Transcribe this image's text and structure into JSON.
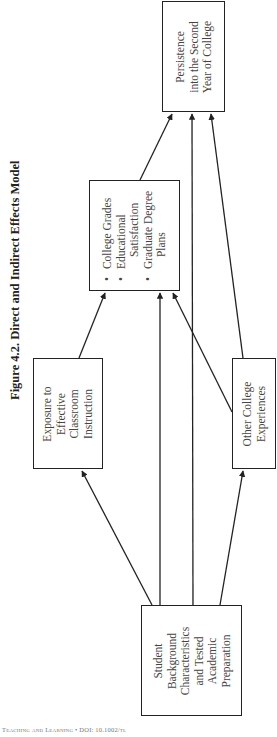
{
  "figure": {
    "title": "Figure 4.2.  Direct and Indirect Effects Model"
  },
  "nodes": {
    "background": {
      "label_lines": [
        "Student",
        "Background",
        "Characteristics",
        "and Tested",
        "Academic",
        "Preparation"
      ]
    },
    "exposure": {
      "label_lines": [
        "Exposure to",
        "Effective",
        "Classroom",
        "Instruction"
      ]
    },
    "other": {
      "label_lines": [
        "Other College",
        "Experiences"
      ]
    },
    "outcomes": {
      "items": [
        {
          "text": "College Grades",
          "bullet": true
        },
        {
          "text": "Educational",
          "bullet": true
        },
        {
          "text": "Satisfaction",
          "bullet": false
        },
        {
          "text": "Graduate Degree",
          "bullet": true
        },
        {
          "text": "Plans",
          "bullet": false
        }
      ]
    },
    "persistence": {
      "label_lines": [
        "Persistence",
        "into the Second",
        "Year of College"
      ]
    }
  },
  "edges": [
    {
      "from": "background",
      "to": "exposure"
    },
    {
      "from": "background",
      "to": "outcomes"
    },
    {
      "from": "background",
      "to": "persistence"
    },
    {
      "from": "background",
      "to": "other"
    },
    {
      "from": "exposure",
      "to": "outcomes"
    },
    {
      "from": "other",
      "to": "outcomes"
    },
    {
      "from": "other",
      "to": "persistence"
    },
    {
      "from": "outcomes",
      "to": "persistence"
    }
  ],
  "footer": {
    "text": "Teaching and Learning • DOI: 10.1002/tl"
  }
}
